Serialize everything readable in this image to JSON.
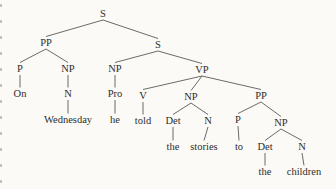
{
  "page": {
    "background": "#fbfaf7"
  },
  "tree": {
    "ink_color": "#2d2d2d",
    "line_color": "#5a5a5a",
    "nodes": [
      {
        "id": "S0",
        "label": "S",
        "x": 103,
        "y": 17
      },
      {
        "id": "PP1",
        "label": "PP",
        "x": 46,
        "y": 46
      },
      {
        "id": "S1",
        "label": "S",
        "x": 158,
        "y": 48
      },
      {
        "id": "P1",
        "label": "P",
        "x": 20,
        "y": 72
      },
      {
        "id": "NP1",
        "label": "NP",
        "x": 68,
        "y": 72
      },
      {
        "id": "NP2",
        "label": "NP",
        "x": 115,
        "y": 72
      },
      {
        "id": "VP",
        "label": "VP",
        "x": 202,
        "y": 73
      },
      {
        "id": "On",
        "label": "On",
        "x": 20,
        "y": 97
      },
      {
        "id": "N1",
        "label": "N",
        "x": 68,
        "y": 97
      },
      {
        "id": "Pro",
        "label": "Pro",
        "x": 115,
        "y": 97
      },
      {
        "id": "V",
        "label": "V",
        "x": 143,
        "y": 99
      },
      {
        "id": "NP3",
        "label": "NP",
        "x": 191,
        "y": 100
      },
      {
        "id": "PP2",
        "label": "PP",
        "x": 261,
        "y": 99
      },
      {
        "id": "Wednesday",
        "label": "Wednesday",
        "x": 68,
        "y": 123
      },
      {
        "id": "he",
        "label": "he",
        "x": 115,
        "y": 123
      },
      {
        "id": "told",
        "label": "told",
        "x": 143,
        "y": 124
      },
      {
        "id": "Det1",
        "label": "Det",
        "x": 173,
        "y": 124
      },
      {
        "id": "N3",
        "label": "N",
        "x": 208,
        "y": 124
      },
      {
        "id": "P2",
        "label": "P",
        "x": 238,
        "y": 123
      },
      {
        "id": "NP4",
        "label": "NP",
        "x": 281,
        "y": 126
      },
      {
        "id": "the1",
        "label": "the",
        "x": 173,
        "y": 150
      },
      {
        "id": "stories",
        "label": "stories",
        "x": 204,
        "y": 150
      },
      {
        "id": "to",
        "label": "to",
        "x": 239,
        "y": 150
      },
      {
        "id": "Det2",
        "label": "Det",
        "x": 265,
        "y": 150
      },
      {
        "id": "N4",
        "label": "N",
        "x": 302,
        "y": 150
      },
      {
        "id": "the2",
        "label": "the",
        "x": 265,
        "y": 175
      },
      {
        "id": "children",
        "label": "children",
        "x": 304,
        "y": 175
      }
    ],
    "edges": [
      [
        "S0",
        "PP1"
      ],
      [
        "S0",
        "S1"
      ],
      [
        "PP1",
        "P1"
      ],
      [
        "PP1",
        "NP1"
      ],
      [
        "S1",
        "NP2"
      ],
      [
        "S1",
        "VP"
      ],
      [
        "P1",
        "On"
      ],
      [
        "NP1",
        "N1"
      ],
      [
        "N1",
        "Wednesday"
      ],
      [
        "NP2",
        "Pro"
      ],
      [
        "Pro",
        "he"
      ],
      [
        "VP",
        "V"
      ],
      [
        "VP",
        "NP3"
      ],
      [
        "VP",
        "PP2"
      ],
      [
        "V",
        "told"
      ],
      [
        "NP3",
        "Det1"
      ],
      [
        "NP3",
        "N3"
      ],
      [
        "Det1",
        "the1"
      ],
      [
        "N3",
        "stories"
      ],
      [
        "PP2",
        "P2"
      ],
      [
        "PP2",
        "NP4"
      ],
      [
        "P2",
        "to"
      ],
      [
        "NP4",
        "Det2"
      ],
      [
        "NP4",
        "N4"
      ],
      [
        "Det2",
        "the2"
      ],
      [
        "N4",
        "children"
      ]
    ]
  },
  "scan_artifacts": {
    "color": "#b9b9b2",
    "marks": [
      {
        "y": 4
      },
      {
        "y": 20
      },
      {
        "y": 36
      },
      {
        "y": 52
      },
      {
        "y": 68
      },
      {
        "y": 84
      },
      {
        "y": 100
      },
      {
        "y": 116
      },
      {
        "y": 132
      },
      {
        "y": 148
      },
      {
        "y": 164
      },
      {
        "y": 180
      }
    ]
  }
}
